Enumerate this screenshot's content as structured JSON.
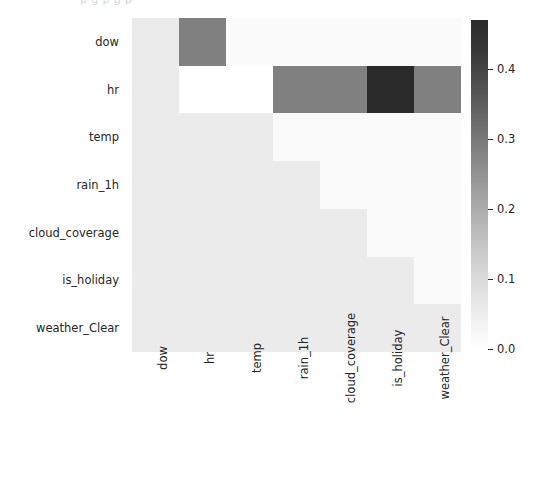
{
  "figure": {
    "clipped_top_text": "p  g  p     g  p",
    "background": "#ffffff"
  },
  "chart_data": {
    "type": "heatmap",
    "title": "",
    "xlabel": "",
    "ylabel": "",
    "categories_x": [
      "dow",
      "hr",
      "temp",
      "rain_1h",
      "cloud_coverage",
      "is_holiday",
      "weather_Clear"
    ],
    "categories_y": [
      "dow",
      "hr",
      "temp",
      "rain_1h",
      "cloud_coverage",
      "is_holiday",
      "weather_Clear"
    ],
    "colormap": "Greys",
    "grid": false,
    "legend": "colorbar-right",
    "zlim": [
      0.0,
      0.47
    ],
    "colorbar": {
      "ticks": [
        0.0,
        0.1,
        0.2,
        0.3,
        0.4
      ],
      "tick_labels": [
        "0.0",
        "0.1",
        "0.2",
        "0.3",
        "0.4"
      ],
      "vmin": 0.0,
      "vmax": 0.47,
      "low_color": "#ffffff",
      "high_color": "#2a2a2a"
    },
    "values": [
      [
        0.03,
        0.255,
        0.01,
        0.01,
        0.01,
        0.01,
        0.01
      ],
      [
        0.03,
        0.0,
        0.0,
        0.255,
        0.255,
        0.45,
        0.255
      ],
      [
        0.03,
        0.03,
        0.03,
        0.01,
        0.01,
        0.01,
        0.01
      ],
      [
        0.03,
        0.03,
        0.03,
        0.03,
        0.01,
        0.01,
        0.01
      ],
      [
        0.03,
        0.03,
        0.03,
        0.03,
        0.03,
        0.01,
        0.01
      ],
      [
        0.03,
        0.03,
        0.03,
        0.03,
        0.03,
        0.03,
        0.01
      ],
      [
        0.03,
        0.03,
        0.03,
        0.03,
        0.03,
        0.03,
        0.03
      ]
    ],
    "cell_colors": [
      [
        "#ebebeb",
        "#808080",
        "#fafafa",
        "#fafafa",
        "#fafafa",
        "#fafafa",
        "#fafafa"
      ],
      [
        "#ebebeb",
        "#ffffff",
        "#ffffff",
        "#808080",
        "#808080",
        "#2a2a2a",
        "#808080"
      ],
      [
        "#ebebeb",
        "#ebebeb",
        "#ebebeb",
        "#fafafa",
        "#fafafa",
        "#fafafa",
        "#fafafa"
      ],
      [
        "#ebebeb",
        "#ebebeb",
        "#ebebeb",
        "#ebebeb",
        "#fafafa",
        "#fafafa",
        "#fafafa"
      ],
      [
        "#ebebeb",
        "#ebebeb",
        "#ebebeb",
        "#ebebeb",
        "#ebebeb",
        "#fafafa",
        "#fafafa"
      ],
      [
        "#ebebeb",
        "#ebebeb",
        "#ebebeb",
        "#ebebeb",
        "#ebebeb",
        "#ebebeb",
        "#fafafa"
      ],
      [
        "#ebebeb",
        "#ebebeb",
        "#ebebeb",
        "#ebebeb",
        "#ebebeb",
        "#ebebeb",
        "#ebebeb"
      ]
    ]
  }
}
